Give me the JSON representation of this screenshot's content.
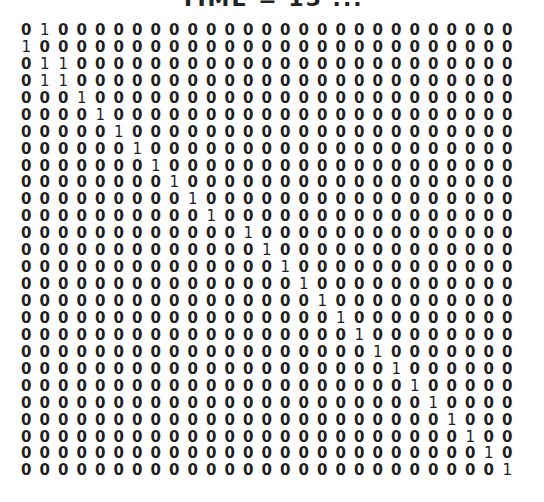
{
  "title": "TIME = 15 ...",
  "matrix": {
    "rows": 27,
    "cols": 27,
    "ones": [
      [
        1
      ],
      [
        0
      ],
      [
        1,
        2
      ],
      [
        1,
        2
      ],
      [
        3
      ],
      [
        4
      ],
      [
        5
      ],
      [
        6
      ],
      [
        7
      ],
      [
        8
      ],
      [
        9
      ],
      [
        10
      ],
      [
        12
      ],
      [
        13
      ],
      [
        14
      ],
      [
        15
      ],
      [
        16
      ],
      [
        17
      ],
      [
        18
      ],
      [
        19
      ],
      [
        20
      ],
      [
        21
      ],
      [
        22
      ],
      [
        23
      ],
      [
        24
      ],
      [
        25
      ],
      [
        26
      ]
    ]
  }
}
